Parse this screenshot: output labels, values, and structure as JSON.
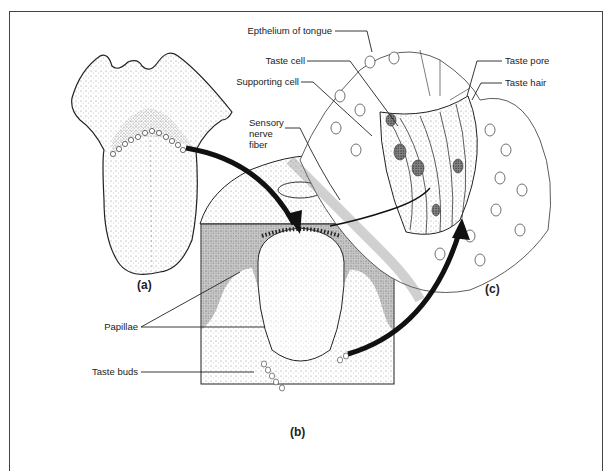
{
  "figure": {
    "panels": {
      "a": "(a)",
      "b": "(b)",
      "c": "(c)"
    },
    "labels": {
      "epithelium": "Epthelium of tongue",
      "taste_cell": "Taste cell",
      "supporting_cell": "Supporting cell",
      "sensory_nerve_1": "Sensory",
      "sensory_nerve_2": "nerve",
      "sensory_nerve_3": "fiber",
      "taste_pore": "Taste pore",
      "taste_hair": "Taste hair",
      "papillae": "Papillae",
      "taste_buds": "Taste buds"
    },
    "colors": {
      "ink": "#222222",
      "stipple": "#777777",
      "background": "#ffffff"
    }
  }
}
